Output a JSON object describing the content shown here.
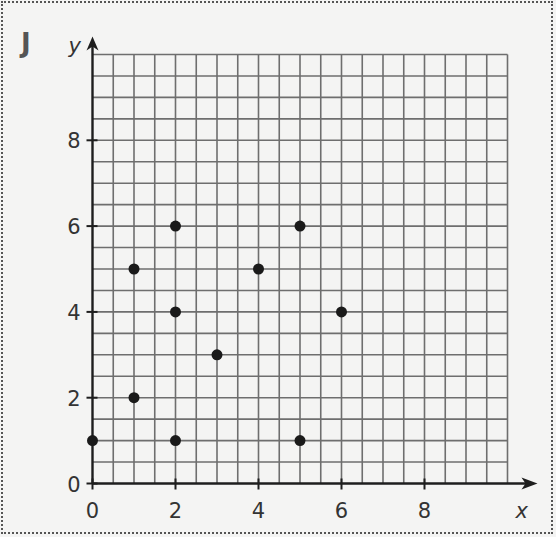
{
  "panel_label": "J",
  "chart_data": {
    "type": "scatter",
    "title": "",
    "xlabel": "x",
    "ylabel": "y",
    "xlim": [
      0,
      10
    ],
    "ylim": [
      0,
      10
    ],
    "grid": true,
    "grid_step": 0.5,
    "x_ticks": [
      0,
      2,
      4,
      6,
      8
    ],
    "y_ticks": [
      0,
      2,
      4,
      6,
      8
    ],
    "points": [
      {
        "x": 0,
        "y": 1
      },
      {
        "x": 1,
        "y": 2
      },
      {
        "x": 2,
        "y": 1
      },
      {
        "x": 1,
        "y": 5
      },
      {
        "x": 2,
        "y": 4
      },
      {
        "x": 2,
        "y": 6
      },
      {
        "x": 3,
        "y": 3
      },
      {
        "x": 4,
        "y": 5
      },
      {
        "x": 5,
        "y": 6
      },
      {
        "x": 6,
        "y": 4
      },
      {
        "x": 5,
        "y": 1
      }
    ],
    "colors": {
      "grid": "#6e6e6e",
      "axis": "#1e1e1e",
      "point": "#1a1a1a"
    },
    "legend": null
  }
}
